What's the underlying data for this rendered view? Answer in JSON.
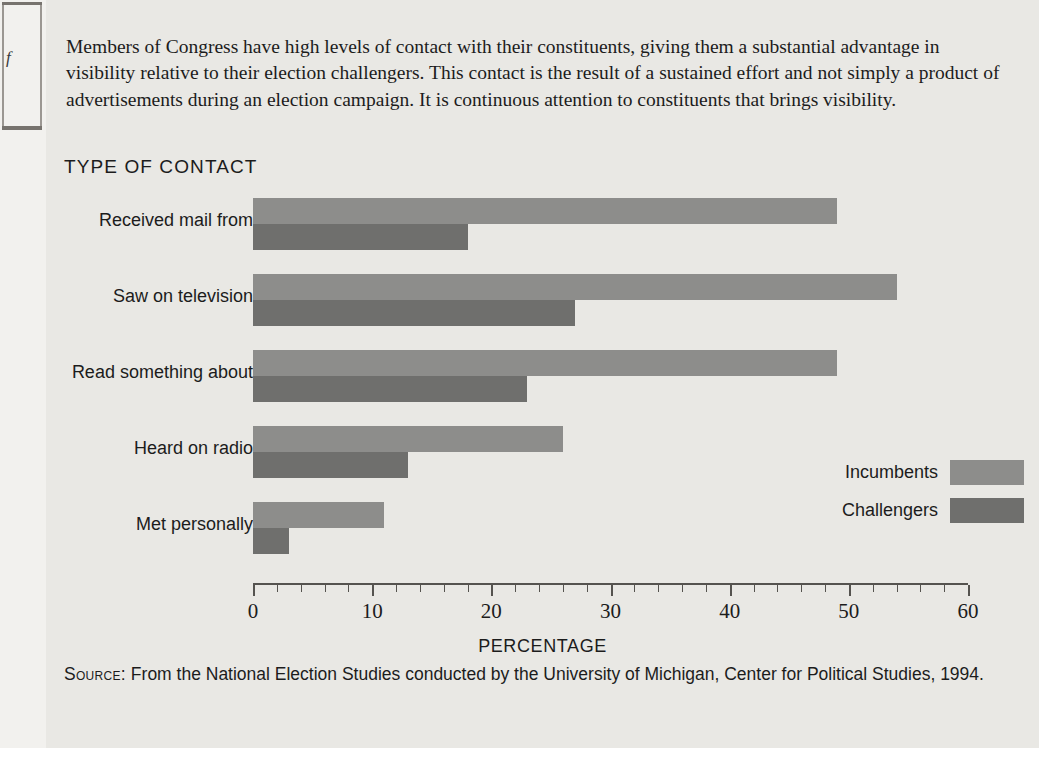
{
  "intro": {
    "paragraph": "Members of Congress have high levels of contact with their constituents, giving them a substantial advantage in visibility relative to their election challengers. This contact is the result of a sustained effort and not simply a product of advertisements during an election campaign. It is continuous attention to constituents that brings visibility."
  },
  "scan_edge": {
    "glyph": "f"
  },
  "source": {
    "label": "Source:",
    "text": "From the National Election Studies conducted by the University of Michigan, Center for Political Studies, 1994."
  },
  "colors": {
    "incumbent": "#8d8d8b",
    "challenger": "#6f6f6d",
    "panel_background": "#e9e8e4",
    "axis": "#55534f",
    "text": "#1c1c1c"
  },
  "chart_data": {
    "type": "bar",
    "orientation": "horizontal",
    "title": "TYPE OF CONTACT",
    "xlabel": "PERCENTAGE",
    "ylabel": "",
    "xlim": [
      0,
      60
    ],
    "xticks": [
      0,
      10,
      20,
      30,
      40,
      50,
      60
    ],
    "xtick_labels": [
      "0",
      "10",
      "20",
      "30",
      "40",
      "50",
      "60"
    ],
    "minor_tick_interval": 2,
    "grid": false,
    "legend_position": "middle-right",
    "categories": [
      "Received mail from",
      "Saw on television",
      "Read something about",
      "Heard on radio",
      "Met personally"
    ],
    "series": [
      {
        "name": "Incumbents",
        "color": "#8d8d8b",
        "values": [
          49,
          54,
          49,
          26,
          11
        ]
      },
      {
        "name": "Challengers",
        "color": "#6f6f6d",
        "values": [
          18,
          27,
          23,
          13,
          3
        ]
      }
    ]
  }
}
